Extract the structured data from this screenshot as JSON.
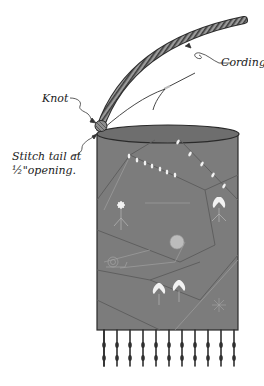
{
  "labels": {
    "cording": "Cording",
    "knot": "Knot",
    "stitch_line1": "Stitch tail at",
    "stitch_line2": "½\"opening."
  },
  "colors": {
    "panel": "#7a7a7a",
    "panel_top": "#6e6e6e",
    "outline": "#2a2a2a",
    "cord": "#8a8a8a",
    "fringe": "#333333",
    "embroidery": "#bdbdbd",
    "highlight": "#f2f2f2"
  },
  "fringe_count": 11
}
